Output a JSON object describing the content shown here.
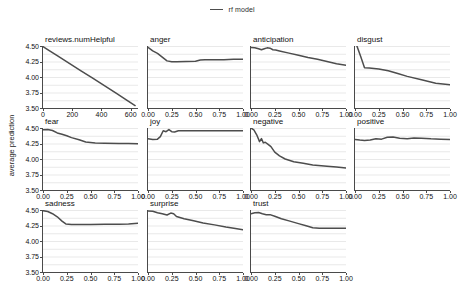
{
  "legend": {
    "label": "rf model",
    "color": "#4d4d4d"
  },
  "axes": {
    "ylabel": "average prediction",
    "yticks": [
      "3.50",
      "3.75",
      "4.00",
      "4.25",
      "4.50"
    ],
    "ylim": [
      3.5,
      4.5
    ],
    "xticks_numeric": [
      "0",
      "200",
      "400",
      "600"
    ],
    "xticks_unit": [
      "0.00",
      "0.25",
      "0.50",
      "0.75",
      "1.00"
    ]
  },
  "chart_data": {
    "type": "line",
    "title": "",
    "xlabel": "",
    "ylabel": "average prediction",
    "ylim": [
      3.5,
      4.5
    ],
    "grid": true,
    "legend_position": "top-center",
    "series_name": "rf model",
    "series_color": "#4d4d4d",
    "panels": [
      {
        "name": "reviews.numHelpful",
        "row": 0,
        "col": 0,
        "xlim": [
          0,
          650
        ],
        "xticks": [
          0,
          200,
          400,
          600
        ],
        "xticklabels": [
          "0",
          "200",
          "400",
          "600"
        ],
        "x": [
          0,
          40,
          100,
          180,
          260,
          340,
          420,
          500,
          570,
          630
        ],
        "y": [
          4.49,
          4.43,
          4.34,
          4.22,
          4.1,
          3.98,
          3.86,
          3.74,
          3.63,
          3.54
        ]
      },
      {
        "name": "anger",
        "row": 0,
        "col": 1,
        "xlim": [
          0,
          1
        ],
        "xticks": [
          0,
          0.25,
          0.5,
          0.75,
          1.0
        ],
        "xticklabels": [
          "0.00",
          "0.25",
          "0.50",
          "0.75",
          "1.00"
        ],
        "x": [
          0.0,
          0.05,
          0.1,
          0.15,
          0.2,
          0.25,
          0.3,
          0.4,
          0.5,
          0.55,
          0.6,
          0.7,
          0.8,
          0.9,
          1.0
        ],
        "y": [
          4.48,
          4.42,
          4.38,
          4.32,
          4.26,
          4.245,
          4.245,
          4.25,
          4.255,
          4.275,
          4.28,
          4.28,
          4.28,
          4.285,
          4.285
        ]
      },
      {
        "name": "anticipation",
        "row": 0,
        "col": 2,
        "xlim": [
          0,
          1
        ],
        "xticks": [
          0,
          0.25,
          0.5,
          0.75,
          1.0
        ],
        "xticklabels": [
          "0.00",
          "0.25",
          "0.50",
          "0.75",
          "1.00"
        ],
        "x": [
          0.0,
          0.04,
          0.08,
          0.11,
          0.14,
          0.17,
          0.2,
          0.23,
          0.26,
          0.3,
          0.4,
          0.5,
          0.6,
          0.7,
          0.8,
          0.9,
          1.0
        ],
        "y": [
          4.475,
          4.472,
          4.455,
          4.44,
          4.455,
          4.47,
          4.465,
          4.44,
          4.435,
          4.42,
          4.385,
          4.35,
          4.315,
          4.285,
          4.25,
          4.215,
          4.19
        ]
      },
      {
        "name": "disgust",
        "row": 0,
        "col": 3,
        "xlim": [
          0,
          1
        ],
        "xticks": [
          0,
          0.25,
          0.5,
          0.75,
          1.0
        ],
        "xticklabels": [
          "0.00",
          "0.25",
          "0.50",
          "0.75",
          "1.00"
        ],
        "x": [
          0.0,
          0.02,
          0.06,
          0.1,
          0.15,
          0.25,
          0.35,
          0.45,
          0.55,
          0.7,
          0.85,
          1.0
        ],
        "y": [
          4.53,
          4.5,
          4.33,
          4.15,
          4.145,
          4.13,
          4.1,
          4.055,
          4.01,
          3.955,
          3.9,
          3.875
        ]
      },
      {
        "name": "fear",
        "row": 1,
        "col": 0,
        "xlim": [
          0,
          1
        ],
        "xticks": [
          0,
          0.25,
          0.5,
          0.75,
          1.0
        ],
        "xticklabels": [
          "0.00",
          "0.25",
          "0.50",
          "0.75",
          "1.00"
        ],
        "x": [
          0.0,
          0.05,
          0.1,
          0.15,
          0.2,
          0.25,
          0.3,
          0.38,
          0.45,
          0.55,
          0.65,
          0.8,
          0.9,
          1.0
        ],
        "y": [
          4.47,
          4.475,
          4.46,
          4.42,
          4.4,
          4.375,
          4.345,
          4.31,
          4.275,
          4.26,
          4.255,
          4.25,
          4.25,
          4.245
        ]
      },
      {
        "name": "joy",
        "row": 1,
        "col": 1,
        "xlim": [
          0,
          1
        ],
        "xticks": [
          0,
          0.25,
          0.5,
          0.75,
          1.0
        ],
        "xticklabels": [
          "0.00",
          "0.25",
          "0.50",
          "0.75",
          "1.00"
        ],
        "x": [
          0.0,
          0.05,
          0.1,
          0.13,
          0.16,
          0.19,
          0.22,
          0.25,
          0.28,
          0.32,
          0.4,
          0.5,
          0.65,
          0.8,
          1.0
        ],
        "y": [
          4.325,
          4.315,
          4.32,
          4.36,
          4.455,
          4.44,
          4.475,
          4.44,
          4.435,
          4.455,
          4.455,
          4.455,
          4.455,
          4.455,
          4.455
        ]
      },
      {
        "name": "negative",
        "row": 1,
        "col": 2,
        "xlim": [
          0,
          1
        ],
        "xticks": [
          0,
          0.25,
          0.5,
          0.75,
          1.0
        ],
        "xticklabels": [
          "0.00",
          "0.25",
          "0.50",
          "0.75",
          "1.00"
        ],
        "x": [
          0.0,
          0.03,
          0.06,
          0.09,
          0.11,
          0.13,
          0.15,
          0.18,
          0.21,
          0.25,
          0.3,
          0.36,
          0.45,
          0.55,
          0.65,
          0.8,
          0.9,
          1.0
        ],
        "y": [
          4.5,
          4.47,
          4.39,
          4.28,
          4.33,
          4.26,
          4.27,
          4.235,
          4.2,
          4.11,
          4.05,
          4.0,
          3.955,
          3.93,
          3.905,
          3.885,
          3.87,
          3.855
        ]
      },
      {
        "name": "positive",
        "row": 1,
        "col": 3,
        "xlim": [
          0,
          1
        ],
        "xticks": [
          0,
          0.25,
          0.5,
          0.75,
          1.0
        ],
        "xticklabels": [
          "0.00",
          "0.25",
          "0.50",
          "0.75",
          "1.00"
        ],
        "x": [
          0.0,
          0.05,
          0.1,
          0.16,
          0.22,
          0.28,
          0.34,
          0.4,
          0.47,
          0.55,
          0.62,
          0.7,
          0.8,
          0.9,
          1.0
        ],
        "y": [
          4.315,
          4.305,
          4.3,
          4.305,
          4.325,
          4.32,
          4.35,
          4.355,
          4.335,
          4.325,
          4.34,
          4.335,
          4.325,
          4.32,
          4.315
        ]
      },
      {
        "name": "sadness",
        "row": 2,
        "col": 0,
        "xlim": [
          0,
          1
        ],
        "xticks": [
          0,
          0.25,
          0.5,
          0.75,
          1.0
        ],
        "xticklabels": [
          "0.00",
          "0.25",
          "0.50",
          "0.75",
          "1.00"
        ],
        "x": [
          0.0,
          0.05,
          0.1,
          0.15,
          0.2,
          0.24,
          0.3,
          0.4,
          0.5,
          0.65,
          0.8,
          0.9,
          1.0
        ],
        "y": [
          4.49,
          4.475,
          4.44,
          4.39,
          4.32,
          4.275,
          4.265,
          4.265,
          4.265,
          4.27,
          4.27,
          4.275,
          4.285
        ]
      },
      {
        "name": "surprise",
        "row": 2,
        "col": 1,
        "xlim": [
          0,
          1
        ],
        "xticks": [
          0,
          0.25,
          0.5,
          0.75,
          1.0
        ],
        "xticklabels": [
          "0.00",
          "0.25",
          "0.50",
          "0.75",
          "1.00"
        ],
        "x": [
          0.0,
          0.05,
          0.1,
          0.15,
          0.2,
          0.24,
          0.27,
          0.3,
          0.38,
          0.48,
          0.58,
          0.7,
          0.82,
          0.92,
          1.0
        ],
        "y": [
          4.485,
          4.48,
          4.455,
          4.44,
          4.42,
          4.45,
          4.44,
          4.395,
          4.36,
          4.325,
          4.29,
          4.26,
          4.225,
          4.2,
          4.18
        ]
      },
      {
        "name": "trust",
        "row": 2,
        "col": 2,
        "xlim": [
          0,
          1
        ],
        "xticks": [
          0,
          0.25,
          0.5,
          0.75,
          1.0
        ],
        "xticklabels": [
          "0.00",
          "0.25",
          "0.50",
          "0.75",
          "1.00"
        ],
        "x": [
          0.0,
          0.04,
          0.08,
          0.12,
          0.16,
          0.2,
          0.25,
          0.32,
          0.4,
          0.5,
          0.58,
          0.65,
          0.72,
          0.8,
          0.9,
          1.0
        ],
        "y": [
          4.44,
          4.455,
          4.46,
          4.44,
          4.425,
          4.425,
          4.4,
          4.36,
          4.325,
          4.28,
          4.245,
          4.215,
          4.205,
          4.205,
          4.205,
          4.205
        ]
      }
    ]
  }
}
